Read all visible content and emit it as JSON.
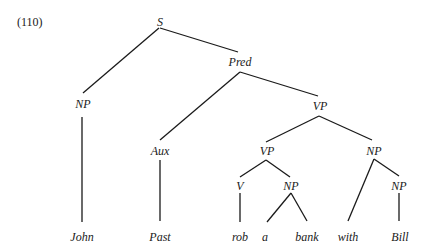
{
  "example_number": "(110)",
  "tree": {
    "nodes": [
      {
        "id": "S",
        "label": "S",
        "x": 160,
        "y": 26
      },
      {
        "id": "NP1",
        "label": "NP",
        "x": 83,
        "y": 108
      },
      {
        "id": "Pred",
        "label": "Pred",
        "x": 240,
        "y": 66
      },
      {
        "id": "Aux",
        "label": "Aux",
        "x": 160,
        "y": 155
      },
      {
        "id": "VP1",
        "label": "VP",
        "x": 320,
        "y": 110
      },
      {
        "id": "VP2",
        "label": "VP",
        "x": 267,
        "y": 155
      },
      {
        "id": "NP2",
        "label": "NP",
        "x": 374,
        "y": 155
      },
      {
        "id": "V",
        "label": "V",
        "x": 240,
        "y": 190
      },
      {
        "id": "NP3",
        "label": "NP",
        "x": 291,
        "y": 190
      },
      {
        "id": "NP4",
        "label": "NP",
        "x": 399,
        "y": 190
      },
      {
        "id": "w_john",
        "label": "John",
        "x": 82,
        "y": 241
      },
      {
        "id": "w_past",
        "label": "Past",
        "x": 160,
        "y": 241
      },
      {
        "id": "w_rob",
        "label": "rob",
        "x": 240,
        "y": 241
      },
      {
        "id": "w_a",
        "label": "a",
        "x": 265,
        "y": 241
      },
      {
        "id": "w_bank",
        "label": "bank",
        "x": 307,
        "y": 241
      },
      {
        "id": "w_with",
        "label": "with",
        "x": 348,
        "y": 241
      },
      {
        "id": "w_bill",
        "label": "Bill",
        "x": 400,
        "y": 241
      }
    ],
    "edges": [
      {
        "from": "S",
        "to": "NP1",
        "x1": 159,
        "y1": 28,
        "x2": 83,
        "y2": 93
      },
      {
        "from": "S",
        "to": "Pred",
        "x1": 160,
        "y1": 28,
        "x2": 238,
        "y2": 52
      },
      {
        "from": "Pred",
        "to": "Aux",
        "x1": 240,
        "y1": 72,
        "x2": 160,
        "y2": 140
      },
      {
        "from": "Pred",
        "to": "VP1",
        "x1": 240,
        "y1": 72,
        "x2": 318,
        "y2": 96
      },
      {
        "from": "NP1",
        "to": "w_john",
        "x1": 82,
        "y1": 117,
        "x2": 82,
        "y2": 222
      },
      {
        "from": "Aux",
        "to": "w_past",
        "x1": 160,
        "y1": 160,
        "x2": 160,
        "y2": 221
      },
      {
        "from": "VP1",
        "to": "VP2",
        "x1": 319,
        "y1": 116,
        "x2": 266,
        "y2": 142
      },
      {
        "from": "VP1",
        "to": "NP2",
        "x1": 319,
        "y1": 116,
        "x2": 372,
        "y2": 140
      },
      {
        "from": "VP2",
        "to": "V",
        "x1": 266,
        "y1": 160,
        "x2": 240,
        "y2": 177
      },
      {
        "from": "VP2",
        "to": "NP3",
        "x1": 266,
        "y1": 160,
        "x2": 290,
        "y2": 177
      },
      {
        "from": "V",
        "to": "w_rob",
        "x1": 240,
        "y1": 193,
        "x2": 240,
        "y2": 222
      },
      {
        "from": "NP3",
        "to": "w_a",
        "x1": 291,
        "y1": 193,
        "x2": 267,
        "y2": 222
      },
      {
        "from": "NP3",
        "to": "w_bank",
        "x1": 291,
        "y1": 193,
        "x2": 307,
        "y2": 221
      },
      {
        "from": "NP2",
        "to": "w_with",
        "x1": 374,
        "y1": 159,
        "x2": 348,
        "y2": 221
      },
      {
        "from": "NP2",
        "to": "NP4",
        "x1": 374,
        "y1": 159,
        "x2": 399,
        "y2": 176
      },
      {
        "from": "NP4",
        "to": "w_bill",
        "x1": 399,
        "y1": 193,
        "x2": 399,
        "y2": 221
      }
    ]
  }
}
